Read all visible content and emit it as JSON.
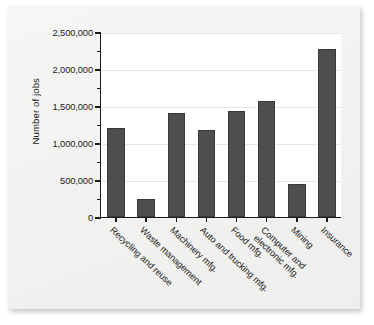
{
  "figure": {
    "background_color": "#f2f2f0",
    "plot_background_color": "#ffffff",
    "bar_color": "#4e4e4e",
    "axis_color": "#1a1a1a",
    "gridline_color": "#e7e7e7"
  },
  "chart_data": {
    "type": "bar",
    "title": "",
    "xlabel": "",
    "ylabel": "Number of jobs",
    "ylim": [
      0,
      2500000
    ],
    "grid": true,
    "legend": null,
    "ytick_labels": [
      "2,500,000",
      "2,000,000",
      "1,500,000",
      "1,000,000",
      "500,000",
      "0"
    ],
    "ytick_values": [
      2500000,
      2000000,
      1500000,
      1000000,
      500000,
      0
    ],
    "minor_tick_interval": 250000,
    "categories": [
      "Recycling and reuse",
      "Waste management",
      "Machinery mfg.",
      "Auto and trucking mfg.",
      "Food mfg.",
      "Computer and\nelectronic mfg.",
      "Mining",
      "Insurance"
    ],
    "values": [
      1200000,
      240000,
      1400000,
      1180000,
      1430000,
      1570000,
      450000,
      2270000
    ]
  }
}
